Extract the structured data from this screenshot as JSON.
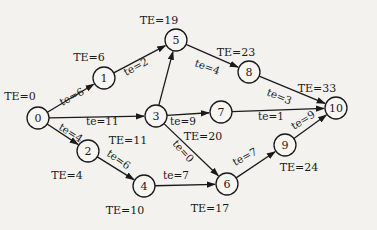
{
  "diagram": {
    "type": "activity-network",
    "background": "#f3f2ef",
    "stroke_color": "#1a1a1a",
    "nodes": [
      {
        "id": "0",
        "label": "0",
        "x": 38,
        "y": 118,
        "te": "TE=0",
        "te_x": 20,
        "te_y": 96
      },
      {
        "id": "1",
        "label": "1",
        "x": 104,
        "y": 78,
        "te": "TE=6",
        "te_x": 89,
        "te_y": 57
      },
      {
        "id": "2",
        "label": "2",
        "x": 88,
        "y": 151,
        "te": "TE=4",
        "te_x": 67,
        "te_y": 175
      },
      {
        "id": "3",
        "label": "3",
        "x": 156,
        "y": 116,
        "te": "TE=11",
        "te_x": 128,
        "te_y": 140
      },
      {
        "id": "4",
        "label": "4",
        "x": 144,
        "y": 186,
        "te": "TE=10",
        "te_x": 125,
        "te_y": 210
      },
      {
        "id": "5",
        "label": "5",
        "x": 176,
        "y": 40,
        "te": "TE=19",
        "te_x": 159,
        "te_y": 20
      },
      {
        "id": "6",
        "label": "6",
        "x": 227,
        "y": 184,
        "te": "TE=17",
        "te_x": 210,
        "te_y": 208
      },
      {
        "id": "7",
        "label": "7",
        "x": 221,
        "y": 112,
        "te": "TE=20",
        "te_x": 203,
        "te_y": 136
      },
      {
        "id": "8",
        "label": "8",
        "x": 249,
        "y": 72,
        "te": "TE=23",
        "te_x": 236,
        "te_y": 52
      },
      {
        "id": "9",
        "label": "9",
        "x": 285,
        "y": 145,
        "te": "TE=24",
        "te_x": 299,
        "te_y": 167
      },
      {
        "id": "10",
        "label": "10",
        "x": 336,
        "y": 108,
        "te": "TE=33",
        "te_x": 317,
        "te_y": 88
      }
    ],
    "edges": [
      {
        "from": "0",
        "to": "1",
        "label": "te=6",
        "lx": 62,
        "ly": 106,
        "rot": -28
      },
      {
        "from": "0",
        "to": "3",
        "label": "te=11",
        "lx": 86,
        "ly": 125,
        "rot": 0
      },
      {
        "from": "0",
        "to": "2",
        "label": "te=4",
        "lx": 58,
        "ly": 129,
        "rot": 32
      },
      {
        "from": "1",
        "to": "5",
        "label": "te=2",
        "lx": 126,
        "ly": 76,
        "rot": -28
      },
      {
        "from": "3",
        "to": "5",
        "label": "",
        "lx": 0,
        "ly": 0,
        "rot": 0
      },
      {
        "from": "3",
        "to": "7",
        "label": "te=9",
        "lx": 170,
        "ly": 125,
        "rot": 0
      },
      {
        "from": "3",
        "to": "6",
        "label": "te=0",
        "lx": 172,
        "ly": 144,
        "rot": 48
      },
      {
        "from": "2",
        "to": "4",
        "label": "te=6",
        "lx": 106,
        "ly": 155,
        "rot": 35
      },
      {
        "from": "4",
        "to": "6",
        "label": "te=7",
        "lx": 163,
        "ly": 179,
        "rot": 0
      },
      {
        "from": "5",
        "to": "8",
        "label": "te=4",
        "lx": 194,
        "ly": 66,
        "rot": 20
      },
      {
        "from": "8",
        "to": "10",
        "label": "te=3",
        "lx": 266,
        "ly": 95,
        "rot": 22
      },
      {
        "from": "7",
        "to": "10",
        "label": "te=1",
        "lx": 258,
        "ly": 120,
        "rot": 0
      },
      {
        "from": "6",
        "to": "9",
        "label": "te=7",
        "lx": 235,
        "ly": 166,
        "rot": -28
      },
      {
        "from": "9",
        "to": "10",
        "label": "te=9",
        "lx": 294,
        "ly": 130,
        "rot": -32
      }
    ]
  }
}
